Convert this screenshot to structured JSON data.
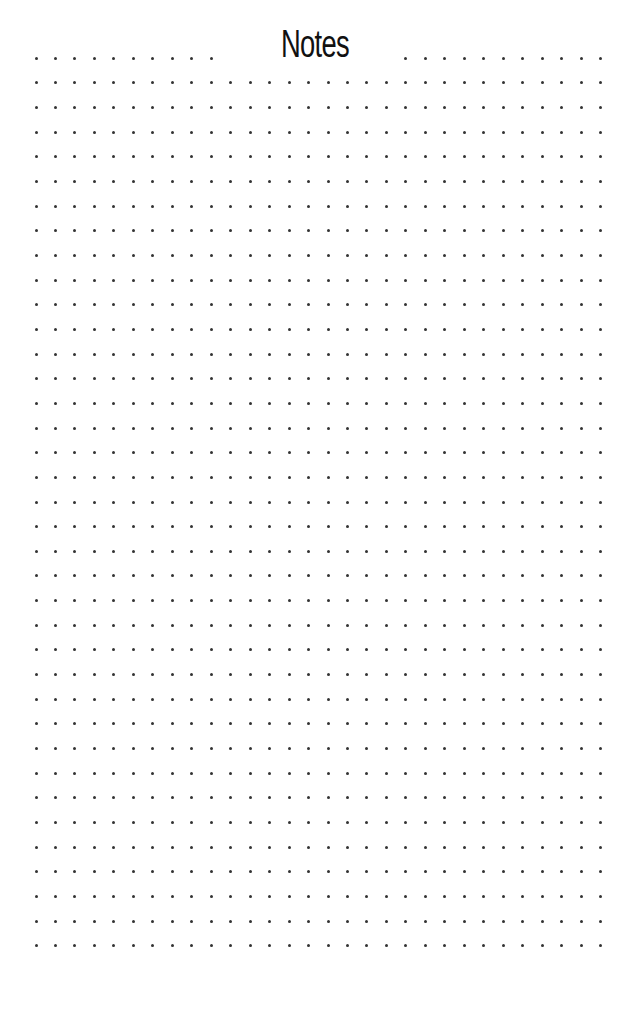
{
  "page": {
    "title": "Notes",
    "background_color": "#ffffff",
    "dot_color": "#333333"
  },
  "dot_grid": {
    "columns": 30,
    "rows": 37,
    "origin_x": 36,
    "origin_y": 58.3,
    "spacing_x": 19.47,
    "spacing_y": 24.65,
    "dot_size": 3,
    "title_row_gap": {
      "row": 0,
      "skip_from_col": 10,
      "skip_to_col": 18
    }
  }
}
